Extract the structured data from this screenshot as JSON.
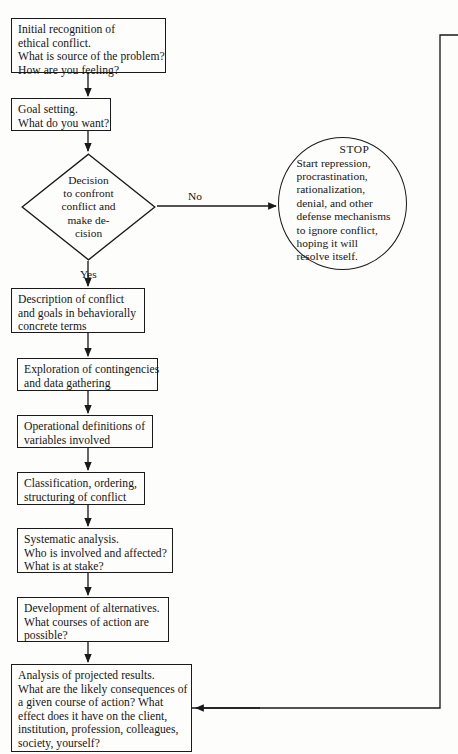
{
  "diagram": {
    "type": "flowchart",
    "colors": {
      "stroke": "#1a1a1a",
      "background": "#fdfdfc",
      "text": "#151515"
    },
    "nodes": [
      {
        "id": "initial-recognition",
        "shape": "rect",
        "x": 11,
        "y": 18,
        "w": 155,
        "h": 55,
        "lines": [
          "Initial recognition of",
          "ethical conflict.",
          "What is source of the problem?",
          "How are you feeling?"
        ]
      },
      {
        "id": "goal-setting",
        "shape": "rect",
        "x": 11,
        "y": 98,
        "w": 100,
        "h": 33,
        "lines": [
          "Goal setting.",
          "What do you want?"
        ]
      },
      {
        "id": "decision-confront",
        "shape": "diamond",
        "x": 21,
        "y": 153,
        "w": 135,
        "h": 108,
        "lines": [
          "Decision",
          "to confront",
          "conflict and",
          "make de-",
          "cision"
        ]
      },
      {
        "id": "stop-circle",
        "shape": "circle",
        "x": 278,
        "y": 137,
        "w": 129,
        "h": 133,
        "header": "STOP",
        "lines": [
          "Start repression,",
          "procrastination,",
          "rationalization,",
          "denial, and other",
          "defense mechanisms",
          "to ignore conflict,",
          "hoping it will",
          "resolve itself."
        ]
      },
      {
        "id": "description-of-conflict",
        "shape": "rect",
        "x": 11,
        "y": 288,
        "w": 134,
        "h": 45,
        "lines": [
          "Description of conflict",
          "and goals in behaviorally",
          "concrete terms"
        ]
      },
      {
        "id": "exploration-contingencies",
        "shape": "rect",
        "x": 17,
        "y": 358,
        "w": 141,
        "h": 33,
        "lines": [
          "Exploration of contingencies",
          "and data gathering"
        ]
      },
      {
        "id": "operational-definitions",
        "shape": "rect",
        "x": 17,
        "y": 415,
        "w": 136,
        "h": 33,
        "lines": [
          "Operational definitions of",
          "variables involved"
        ]
      },
      {
        "id": "classification-ordering",
        "shape": "rect",
        "x": 17,
        "y": 472,
        "w": 128,
        "h": 33,
        "lines": [
          "Classification, ordering,",
          "structuring of conflict"
        ]
      },
      {
        "id": "systematic-analysis",
        "shape": "rect",
        "x": 17,
        "y": 528,
        "w": 156,
        "h": 45,
        "lines": [
          "Systematic analysis.",
          "Who is involved and affected?",
          "What is at stake?"
        ]
      },
      {
        "id": "development-alternatives",
        "shape": "rect",
        "x": 17,
        "y": 597,
        "w": 152,
        "h": 45,
        "lines": [
          "Development of alternatives.",
          "What courses of action are",
          "possible?"
        ]
      },
      {
        "id": "analysis-projected-results",
        "shape": "rect",
        "x": 11,
        "y": 664,
        "w": 181,
        "h": 88,
        "lines": [
          "Analysis of projected results.",
          "What are the likely consequences of",
          "a given course of action? What",
          "effect does it have on the client,",
          "institution, profession, colleagues,",
          "society, yourself?"
        ]
      }
    ],
    "edge_labels": [
      {
        "id": "label-no",
        "text": "No",
        "x": 188,
        "y": 190
      },
      {
        "id": "label-yes",
        "text": "Yes",
        "x": 80,
        "y": 268
      }
    ]
  }
}
